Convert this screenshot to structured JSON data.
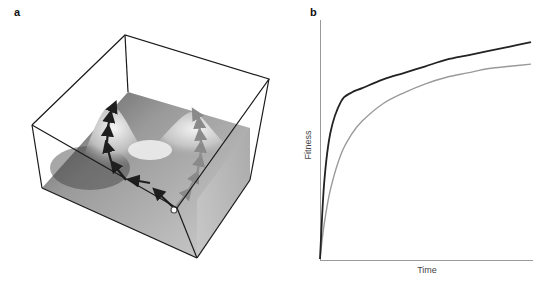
{
  "panels": {
    "a": {
      "label": "a",
      "description": "3D fitness landscape with two peaks; black arrow path climbs left peak, gray arrow path climbs right peak from a common start point"
    },
    "b": {
      "label": "b",
      "xlabel": "Time",
      "ylabel": "Fitness"
    }
  },
  "chart_data": [
    {
      "type": "surface",
      "title": "",
      "panel": "a",
      "features": [
        "two-peaked landscape",
        "start point (open circle)",
        "black adaptive path to left peak",
        "gray adaptive path to right peak"
      ],
      "colors": {
        "path_primary": "#222222",
        "path_secondary": "#8a8a8a",
        "box": "#222222"
      }
    },
    {
      "type": "line",
      "panel": "b",
      "title": "",
      "xlabel": "Time",
      "ylabel": "Fitness",
      "grid": false,
      "legend": "none",
      "x": [
        0,
        0.02,
        0.05,
        0.1,
        0.15,
        0.2,
        0.3,
        0.4,
        0.5,
        0.6,
        0.7,
        0.8,
        0.9,
        1.0
      ],
      "series": [
        {
          "name": "black curve",
          "color": "#222222",
          "values": [
            0.0,
            0.35,
            0.58,
            0.72,
            0.76,
            0.78,
            0.82,
            0.85,
            0.88,
            0.91,
            0.93,
            0.95,
            0.97,
            0.99
          ]
        },
        {
          "name": "gray curve",
          "color": "#9a9a9a",
          "values": [
            0.0,
            0.16,
            0.32,
            0.48,
            0.57,
            0.63,
            0.71,
            0.76,
            0.8,
            0.83,
            0.85,
            0.87,
            0.88,
            0.89
          ]
        }
      ],
      "ylim": [
        0,
        1
      ],
      "xlim": [
        0,
        1
      ]
    }
  ]
}
